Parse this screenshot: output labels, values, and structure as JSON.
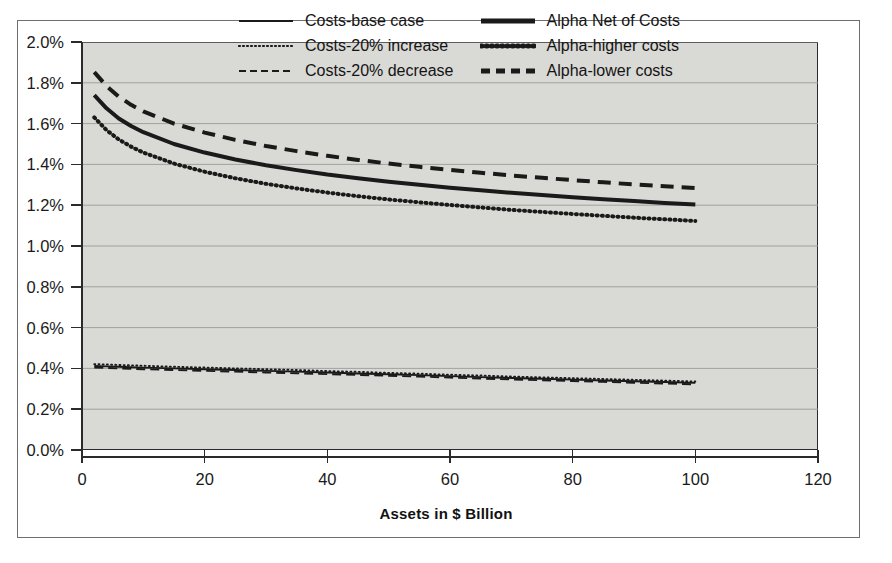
{
  "figure": {
    "clipped_title": "",
    "background_color": "#ffffff",
    "frame_color": "#6f6f6f",
    "plot_background_color": "#d9d9d6",
    "axis_color": "#2b2b2b",
    "gridline_color": "#9a9a97",
    "series_color": "#1a1a1a"
  },
  "chart_data": {
    "type": "line",
    "title": "",
    "xlabel": "Assets in $ Billion",
    "ylabel": "",
    "xlim": [
      0,
      120
    ],
    "ylim": [
      0,
      0.02
    ],
    "grid": "horizontal",
    "legend_position": "top-right-inside",
    "xticks": [
      0,
      20,
      40,
      60,
      80,
      100,
      120
    ],
    "xticklabels": [
      "0",
      "20",
      "40",
      "60",
      "80",
      "100",
      "120"
    ],
    "yticks": [
      0.0,
      0.002,
      0.004,
      0.006,
      0.008,
      0.01,
      0.012,
      0.014,
      0.016,
      0.018,
      0.02
    ],
    "yticklabels": [
      "0.0%",
      "0.2%",
      "0.4%",
      "0.6%",
      "0.8%",
      "1.0%",
      "1.2%",
      "1.4%",
      "1.6%",
      "1.8%",
      "2.0%"
    ],
    "x": [
      2,
      4,
      6,
      8,
      10,
      15,
      20,
      25,
      30,
      35,
      40,
      45,
      50,
      55,
      60,
      65,
      70,
      75,
      80,
      85,
      90,
      95,
      100
    ],
    "series": [
      {
        "name": "Costs-base case",
        "style": "solid",
        "width": "thin",
        "values": [
          0.00412,
          0.0041,
          0.00408,
          0.00406,
          0.00404,
          0.004,
          0.00396,
          0.00392,
          0.00388,
          0.00384,
          0.0038,
          0.00375,
          0.00371,
          0.00367,
          0.00362,
          0.00357,
          0.00353,
          0.00349,
          0.00345,
          0.00341,
          0.00337,
          0.00333,
          0.00329
        ]
      },
      {
        "name": "Costs-20% increase",
        "style": "dotted",
        "width": "thin",
        "values": [
          0.00421,
          0.00419,
          0.00417,
          0.00415,
          0.00413,
          0.00408,
          0.00404,
          0.004,
          0.00396,
          0.00392,
          0.00387,
          0.00383,
          0.00378,
          0.00374,
          0.00369,
          0.00365,
          0.0036,
          0.00356,
          0.00352,
          0.00348,
          0.00344,
          0.0034,
          0.00336
        ]
      },
      {
        "name": "Costs-20% decrease",
        "style": "dashed",
        "width": "thin",
        "values": [
          0.00404,
          0.00402,
          0.004,
          0.00398,
          0.00396,
          0.00392,
          0.00388,
          0.00384,
          0.0038,
          0.00376,
          0.00372,
          0.00368,
          0.00364,
          0.0036,
          0.00355,
          0.0035,
          0.00346,
          0.00342,
          0.00338,
          0.00334,
          0.0033,
          0.00326,
          0.00322
        ]
      },
      {
        "name": "Alpha Net of Costs",
        "style": "solid",
        "width": "thick",
        "values": [
          0.0174,
          0.01675,
          0.01625,
          0.01588,
          0.01558,
          0.015,
          0.01458,
          0.01424,
          0.01396,
          0.01372,
          0.0135,
          0.01332,
          0.01315,
          0.013,
          0.01286,
          0.01273,
          0.01261,
          0.0125,
          0.01239,
          0.01229,
          0.0122,
          0.01211,
          0.01203
        ]
      },
      {
        "name": "Alpha-higher costs",
        "style": "dotted",
        "width": "thick",
        "values": [
          0.0163,
          0.01568,
          0.01522,
          0.01487,
          0.01458,
          0.01404,
          0.01364,
          0.01332,
          0.01305,
          0.01282,
          0.01262,
          0.01244,
          0.01228,
          0.01214,
          0.01201,
          0.01189,
          0.01177,
          0.01167,
          0.01157,
          0.01148,
          0.01139,
          0.01131,
          0.01123
        ]
      },
      {
        "name": "Alpha-lower costs",
        "style": "dashed",
        "width": "thick",
        "values": [
          0.01852,
          0.01784,
          0.01732,
          0.01692,
          0.0166,
          0.016,
          0.01556,
          0.0152,
          0.0149,
          0.01465,
          0.01442,
          0.01422,
          0.01404,
          0.01388,
          0.01373,
          0.01359,
          0.01346,
          0.01334,
          0.01323,
          0.01312,
          0.01302,
          0.01293,
          0.01284
        ]
      }
    ]
  },
  "legend": {
    "columns": [
      {
        "items": [
          {
            "label": "Costs-base case",
            "swatch": "solid-thin-line-icon"
          },
          {
            "label": "Costs-20% increase",
            "swatch": "dotted-thin-line-icon"
          },
          {
            "label": "Costs-20% decrease",
            "swatch": "dashed-thin-line-icon"
          }
        ]
      },
      {
        "items": [
          {
            "label": "Alpha Net of Costs",
            "swatch": "solid-thick-line-icon"
          },
          {
            "label": "Alpha-higher costs",
            "swatch": "dotted-thick-line-icon"
          },
          {
            "label": "Alpha-lower costs",
            "swatch": "dashed-thick-line-icon"
          }
        ]
      }
    ]
  }
}
